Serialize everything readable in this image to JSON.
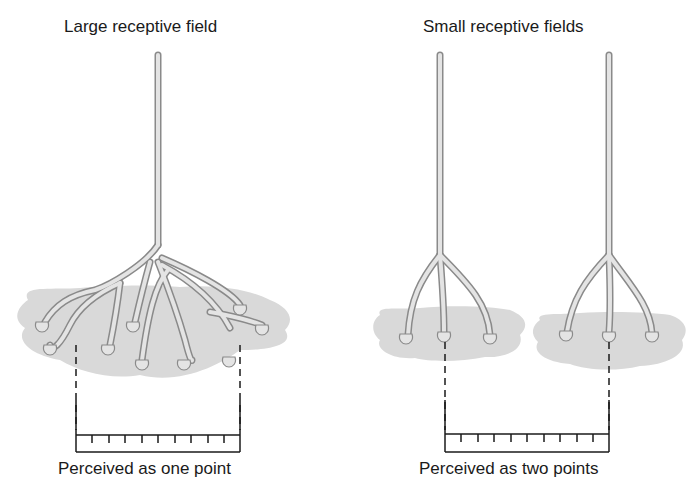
{
  "left_panel": {
    "title": "Large receptive field",
    "caption": "Perceived as one point"
  },
  "right_panel": {
    "title": "Small receptive fields",
    "caption": "Perceived as two points"
  },
  "colors": {
    "skin_patch": "#d9d9d9",
    "neuron_fill": "#e4e4e4",
    "neuron_outline": "#8a8a8a",
    "ruler": "#1a1a1a"
  }
}
